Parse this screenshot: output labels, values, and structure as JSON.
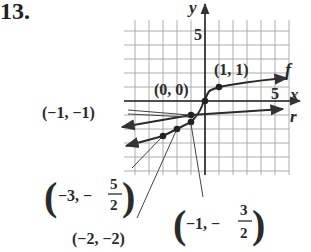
{
  "problem_number": "13.",
  "axes": {
    "x_label": "x",
    "y_label": "y",
    "x_tick_label": "5",
    "y_tick_label": "5"
  },
  "curve_labels": {
    "f": "f",
    "r": "r"
  },
  "point_labels": {
    "p00": "(0, 0)",
    "p11": "(1, 1)",
    "pm1m1": "(−1, −1)",
    "pm2m2": "(−2, −2)",
    "pm3_prefix": "−3, −",
    "pm3_num": "5",
    "pm3_den": "2",
    "pm1_prefix": "−1, −",
    "pm1_num": "3",
    "pm1_den": "2"
  },
  "chart_data": {
    "type": "line",
    "title": "",
    "xlabel": "x",
    "ylabel": "y",
    "xlim": [
      -5.8,
      6
    ],
    "ylim": [
      -5.3,
      5.8
    ],
    "grid": true,
    "series": [
      {
        "name": "f",
        "points": [
          [
            -6,
            -3.2
          ],
          [
            -3,
            -2.5
          ],
          [
            -2,
            -2
          ],
          [
            -1,
            -1.5
          ],
          [
            -0.3,
            -0.8
          ],
          [
            0,
            0
          ],
          [
            0.3,
            0.6
          ],
          [
            1,
            1
          ],
          [
            3,
            1.4
          ],
          [
            5,
            1.6
          ]
        ],
        "marked_points": [
          [
            -3,
            -2.5
          ],
          [
            -2,
            -2
          ],
          [
            -1,
            -1.5
          ],
          [
            0,
            0
          ],
          [
            1,
            1
          ]
        ]
      },
      {
        "name": "r",
        "points": [
          [
            -6,
            -1.9
          ],
          [
            -1,
            -1
          ],
          [
            5,
            -0.6
          ]
        ],
        "marked_points": [
          [
            -1,
            -1
          ]
        ]
      }
    ],
    "annotations": [
      "(0, 0)",
      "(1, 1)",
      "(−1, −1)",
      "(−2, −2)",
      "(−3, −5/2)",
      "(−1, −3/2)"
    ]
  }
}
